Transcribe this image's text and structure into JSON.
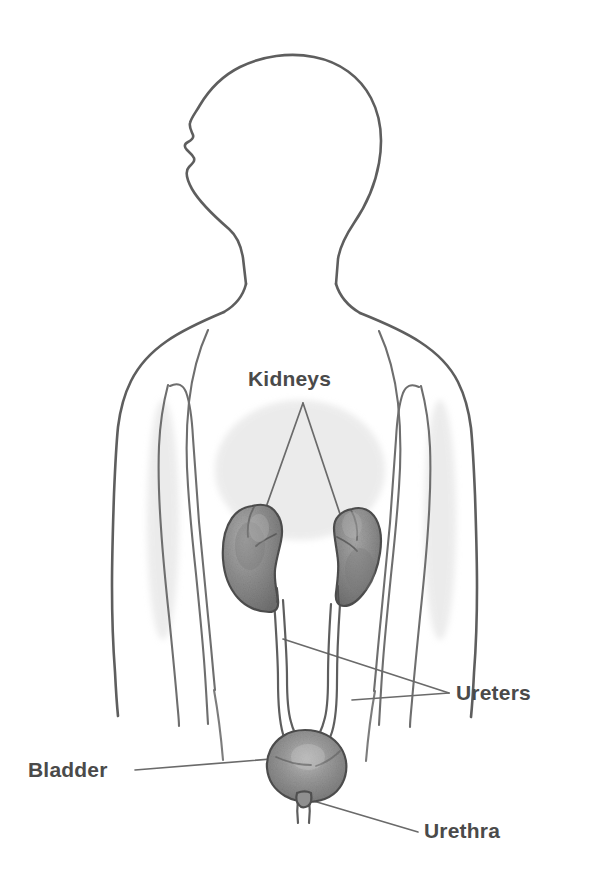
{
  "figure": {
    "background_color": "#ffffff",
    "line_color": "#5e5e5e",
    "label_color": "#4a4a4a",
    "organ_fill_color": "#8a8a8a",
    "organ_highlight_color": "#b4b4b4",
    "organ_shadow_color": "#6b6b6b"
  },
  "labels": {
    "kidneys": {
      "text": "Kidneys",
      "x": 248,
      "y": 386,
      "anchor": "start"
    },
    "ureters": {
      "text": "Ureters",
      "x": 456,
      "y": 700,
      "anchor": "start"
    },
    "bladder": {
      "text": "Bladder",
      "x": 28,
      "y": 777,
      "anchor": "start"
    },
    "urethra": {
      "text": "Urethra",
      "x": 424,
      "y": 838,
      "anchor": "start"
    }
  },
  "organs": {
    "left_kidney": {
      "name": "left-kidney",
      "cx": 254,
      "cy": 555
    },
    "right_kidney": {
      "name": "right-kidney",
      "cx": 351,
      "cy": 558
    },
    "bladder": {
      "name": "bladder",
      "cx": 305,
      "cy": 762
    },
    "left_ureter": {
      "name": "left-ureter"
    },
    "right_ureter": {
      "name": "right-ureter"
    },
    "urethra": {
      "name": "urethra"
    }
  },
  "leader_lines": {
    "kidneys_left": "from label apex down-left to left kidney",
    "kidneys_right": "from label apex down-right to right kidney",
    "ureters_upper": "from left ureter to label point",
    "ureters_lower": "from right ureter to label point",
    "bladder": "from label right edge to bladder",
    "urethra": "from urethra neck down-right to label"
  },
  "top_cropped_caption": ""
}
